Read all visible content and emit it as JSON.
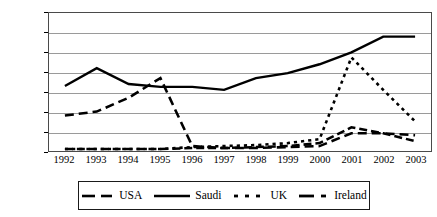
{
  "chart_data": {
    "type": "line",
    "title": "",
    "xlabel": "",
    "ylabel": "",
    "x": [
      "1992",
      "1993",
      "1994",
      "1995",
      "1996",
      "1997",
      "1998",
      "1999",
      "2000",
      "2001",
      "2002",
      "2003"
    ],
    "categories": [
      "1992",
      "1993",
      "1994",
      "1995",
      "1996",
      "1997",
      "1998",
      "1999",
      "2000",
      "2001",
      "2002",
      "2003"
    ],
    "ylim": [
      0,
      7000
    ],
    "ytick_values": [
      0,
      1000,
      2000,
      3000,
      4000,
      5000,
      6000,
      7000
    ],
    "ytick_labels": [
      "0",
      "1000",
      "2000",
      "3000",
      "4000",
      "5000",
      "6000",
      "7000"
    ],
    "grid": true,
    "legend_position": "bottom",
    "series": [
      {
        "name": "USA",
        "style": "long-dash",
        "color": "#000000",
        "values": [
          1800,
          2000,
          2700,
          3700,
          250,
          150,
          150,
          200,
          250,
          900,
          900,
          800
        ]
      },
      {
        "name": "Saudi",
        "style": "solid",
        "color": "#000000",
        "values": [
          3300,
          4200,
          3400,
          3250,
          3250,
          3100,
          3700,
          3950,
          4400,
          5000,
          5800,
          5800
        ]
      },
      {
        "name": "UK",
        "style": "dotted",
        "color": "#000000",
        "values": [
          100,
          100,
          100,
          100,
          200,
          250,
          300,
          400,
          600,
          4750,
          3100,
          1500
        ]
      },
      {
        "name": "Ireland",
        "style": "dash-dot",
        "color": "#000000",
        "values": [
          100,
          100,
          100,
          100,
          150,
          150,
          200,
          250,
          400,
          1200,
          900,
          500
        ]
      }
    ]
  },
  "legend": {
    "items": [
      {
        "label": "USA",
        "icon": "long-dash-line-swatch"
      },
      {
        "label": "Saudi",
        "icon": "solid-line-swatch"
      },
      {
        "label": "UK",
        "icon": "dotted-line-swatch"
      },
      {
        "label": "Ireland",
        "icon": "dash-dot-line-swatch"
      }
    ]
  }
}
